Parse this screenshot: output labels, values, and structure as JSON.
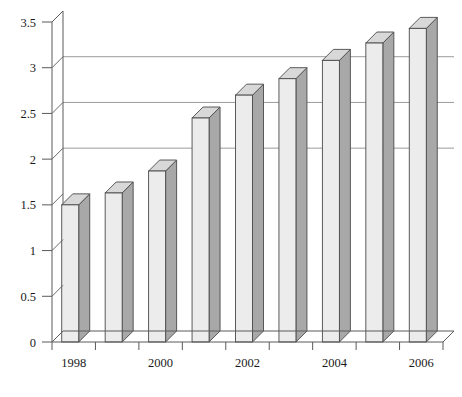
{
  "chart_data": {
    "type": "bar",
    "title": "",
    "subtitle": "",
    "xlabel": "",
    "ylabel": "",
    "categories": [
      "1998",
      "1999",
      "2000",
      "2001",
      "2002",
      "2003",
      "2004",
      "2005",
      "2006"
    ],
    "values": [
      1.5,
      1.63,
      1.87,
      2.45,
      2.7,
      2.88,
      3.08,
      3.27,
      3.43
    ],
    "series": [
      {
        "name": "",
        "values": [
          1.5,
          1.63,
          1.87,
          2.45,
          2.7,
          2.88,
          3.08,
          3.27,
          3.43
        ]
      }
    ],
    "ylim": [
      0,
      3.5
    ],
    "ytick_values": [
      0,
      0.5,
      1,
      1.5,
      2,
      2.5,
      3,
      3.5
    ],
    "ytick_labels": [
      "0",
      "0.5",
      "1",
      "1.5",
      "2",
      "2.5",
      "3",
      "3.5"
    ],
    "xtick_labels": [
      "1998",
      "",
      "2000",
      "",
      "2002",
      "",
      "2004",
      "",
      "2006"
    ],
    "xtick_labels_visible": [
      "1998",
      "2000",
      "2002",
      "2004",
      "2006"
    ],
    "grid": true,
    "grid_axis": "y",
    "legend": false,
    "legend_position": "none",
    "style": "3d-column",
    "annotations": [],
    "colors": {
      "bar_front": "#ececec",
      "bar_side": "#a8a8a8",
      "bar_top": "#d8d8d8",
      "bar_outline": "#4a4a4a",
      "grid_line": "#8f8f8f",
      "axis_line": "#5a5a5a",
      "background": "#ffffff",
      "text": "#1a1a1a"
    }
  }
}
